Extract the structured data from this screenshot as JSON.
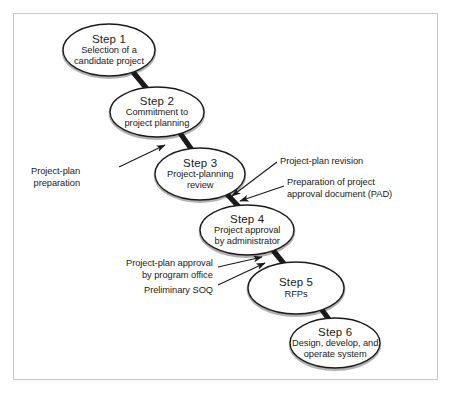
{
  "figure": {
    "kind": "process-flow-diagram",
    "orientation": "descending-cascade",
    "border_color": "#c9c9c9",
    "background_color": "#ffffff",
    "ink_color": "#1a1a1a"
  },
  "nodes": [
    {
      "id": "step-1",
      "title": "Step 1",
      "desc_lines": [
        "Selection of a",
        "candidate project"
      ],
      "cx": 109,
      "cy": 50,
      "rx": 46,
      "ry": 26
    },
    {
      "id": "step-2",
      "title": "Step 2",
      "desc_lines": [
        "Commitment to",
        "project planning"
      ],
      "cx": 157,
      "cy": 112,
      "rx": 47,
      "ry": 25
    },
    {
      "id": "step-3",
      "title": "Step 3",
      "desc_lines": [
        "Project-planning",
        "review"
      ],
      "cx": 200,
      "cy": 174,
      "rx": 45,
      "ry": 26
    },
    {
      "id": "step-4",
      "title": "Step 4",
      "desc_lines": [
        "Project approval",
        "by administrator"
      ],
      "cx": 247,
      "cy": 230,
      "rx": 47,
      "ry": 25
    },
    {
      "id": "step-5",
      "title": "Step 5",
      "desc_lines": [
        "RFPs"
      ],
      "cx": 296,
      "cy": 288,
      "rx": 48,
      "ry": 26
    },
    {
      "id": "step-6",
      "title": "Step 6",
      "desc_lines": [
        "Design, develop, and",
        "operate system"
      ],
      "cx": 335,
      "cy": 343,
      "rx": 45,
      "ry": 25
    }
  ],
  "connectors": [
    {
      "id": "c1",
      "from": "step-1",
      "to": "step-2",
      "x1": 133,
      "y1": 72,
      "x2": 147,
      "y2": 89
    },
    {
      "id": "c2",
      "from": "step-2",
      "to": "step-3",
      "x1": 180,
      "y1": 133,
      "x2": 192,
      "y2": 150
    },
    {
      "id": "c3",
      "from": "step-3",
      "to": "step-4",
      "x1": 225,
      "y1": 192,
      "x2": 239,
      "y2": 207
    },
    {
      "id": "c4",
      "from": "step-4",
      "to": "step-5",
      "x1": 272,
      "y1": 249,
      "x2": 285,
      "y2": 265
    },
    {
      "id": "c5",
      "from": "step-5",
      "to": "step-6",
      "x1": 320,
      "y1": 307,
      "x2": 330,
      "y2": 321
    }
  ],
  "annotations": [
    {
      "id": "project-plan-preparation",
      "lines": [
        "Project-plan",
        "preparation"
      ],
      "side": "left",
      "text_x": 80,
      "text_y": 166,
      "line": {
        "x1": 119,
        "y1": 167,
        "x2": 165,
        "y2": 145
      }
    },
    {
      "id": "project-plan-revision",
      "lines": [
        "Project-plan revision"
      ],
      "side": "right",
      "text_x": 280,
      "text_y": 156,
      "line": {
        "x1": 277,
        "y1": 162,
        "x2": 232,
        "y2": 196
      }
    },
    {
      "id": "preparation-of-pad",
      "lines": [
        "Preparation of project",
        "approval document (PAD)"
      ],
      "side": "right",
      "text_x": 287,
      "text_y": 177,
      "line": {
        "x1": 284,
        "y1": 186,
        "x2": 240,
        "y2": 201
      }
    },
    {
      "id": "project-plan-approval-program-office",
      "lines": [
        "Project-plan approval",
        "by program office"
      ],
      "side": "left",
      "text_x": 213,
      "text_y": 258,
      "line": {
        "x1": 218,
        "y1": 267,
        "x2": 262,
        "y2": 257
      }
    },
    {
      "id": "preliminary-soq",
      "lines": [
        "Preliminary SOQ"
      ],
      "side": "left",
      "text_x": 213,
      "text_y": 285,
      "line": {
        "x1": 218,
        "y1": 285,
        "x2": 265,
        "y2": 263
      }
    }
  ]
}
